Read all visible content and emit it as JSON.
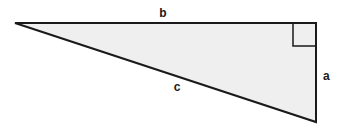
{
  "diagram": {
    "type": "right-triangle",
    "fill_color": "#efefef",
    "stroke_color": "#1a1a1a",
    "vertices": {
      "left": [
        15,
        23
      ],
      "right_angle": [
        316,
        23
      ],
      "bottom": [
        316,
        122
      ]
    },
    "right_angle_marker": {
      "size": 23
    },
    "labels": {
      "top_side": "b",
      "right_side": "a",
      "hypotenuse": "c"
    }
  }
}
